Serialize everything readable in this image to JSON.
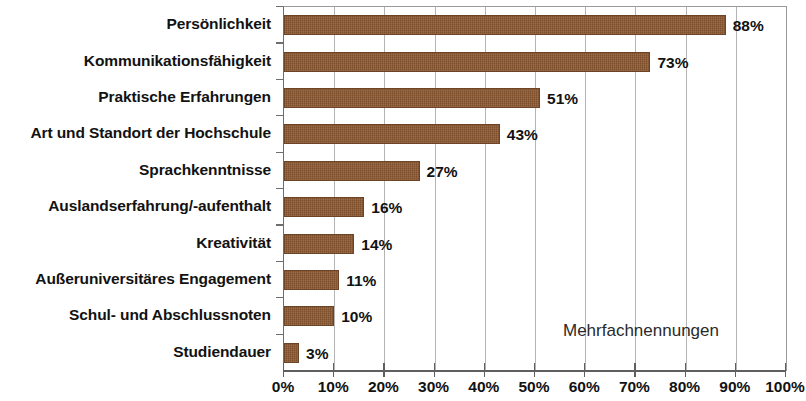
{
  "chart_data": {
    "type": "bar",
    "orientation": "horizontal",
    "title": "",
    "subtitle": "",
    "xlabel": "",
    "ylabel": "",
    "xlim": [
      0,
      100
    ],
    "xtick_step": 10,
    "grid": true,
    "grid_axis": "x",
    "legend": "none",
    "bar_color": "#8a5730",
    "value_label_suffix": "%",
    "annotation": "Mehrfachnennungen",
    "annotation_position": "bottom-right-inside-plot",
    "categories": [
      "Persönlichkeit",
      "Kommunikationsfähigkeit",
      "Praktische Erfahrungen",
      "Art und Standort der Hochschule",
      "Sprachkenntnisse",
      "Auslandserfahrung/-aufenthalt",
      "Kreativität",
      "Außeruniversitäres Engagement",
      "Schul- und Abschlussnoten",
      "Studiendauer"
    ],
    "values": [
      88,
      73,
      51,
      43,
      27,
      16,
      14,
      11,
      10,
      3
    ],
    "value_labels": [
      "88%",
      "73%",
      "51%",
      "43%",
      "27%",
      "16%",
      "14%",
      "11%",
      "10%",
      "3%"
    ],
    "xtick_labels": [
      "0%",
      "10%",
      "20%",
      "30%",
      "40%",
      "50%",
      "60%",
      "70%",
      "80%",
      "90%",
      "100%"
    ],
    "xtick_values": [
      0,
      10,
      20,
      30,
      40,
      50,
      60,
      70,
      80,
      90,
      100
    ]
  }
}
